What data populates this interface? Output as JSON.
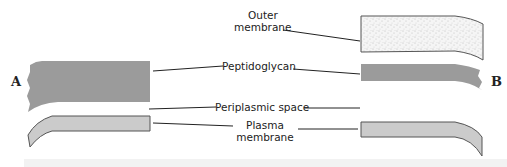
{
  "diagram": {
    "side_labels": {
      "left": "A",
      "right": "B"
    },
    "labels": {
      "outer_membrane_line1": "Outer",
      "outer_membrane_line2": "membrane",
      "peptidoglycan": "Peptidoglycan",
      "periplasmic_space": "Periplasmic space",
      "plasma_membrane_line1": "Plasma",
      "plasma_membrane_line2": "membrane"
    },
    "colors": {
      "peptidoglycan_fill": "#9a9a9a",
      "plasma_membrane_fill": "#c9c9c9",
      "outer_membrane_fill": "#f4f4f4",
      "stipple": "#8a8a8a",
      "outline": "#555555",
      "leader_line": "#222222"
    }
  }
}
